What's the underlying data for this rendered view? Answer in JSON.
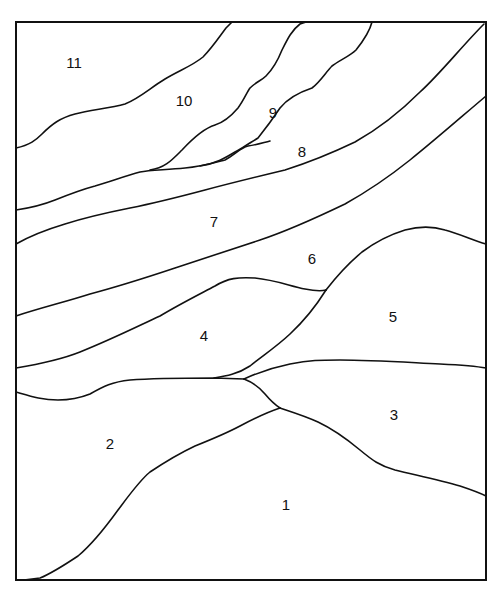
{
  "diagram": {
    "type": "numbered region map (paint-by-number style landscape)",
    "stroke_color": "#111111",
    "background": "#ffffff",
    "regions": [
      {
        "id": "1",
        "label": "1",
        "x": 286,
        "y": 504
      },
      {
        "id": "2",
        "label": "2",
        "x": 110,
        "y": 443
      },
      {
        "id": "3",
        "label": "3",
        "x": 394,
        "y": 414
      },
      {
        "id": "4",
        "label": "4",
        "x": 204,
        "y": 335
      },
      {
        "id": "5",
        "label": "5",
        "x": 393,
        "y": 316
      },
      {
        "id": "6",
        "label": "6",
        "x": 312,
        "y": 258
      },
      {
        "id": "7",
        "label": "7",
        "x": 214,
        "y": 221
      },
      {
        "id": "8",
        "label": "8",
        "x": 302,
        "y": 151
      },
      {
        "id": "9",
        "label": "9",
        "x": 273,
        "y": 112
      },
      {
        "id": "10",
        "label": "10",
        "x": 184,
        "y": 100
      },
      {
        "id": "11",
        "label": "11",
        "x": 74,
        "y": 62
      }
    ]
  }
}
